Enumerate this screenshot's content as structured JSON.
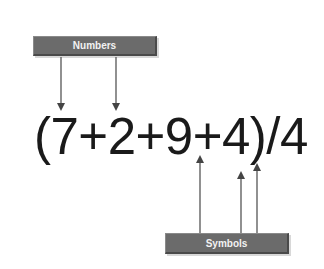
{
  "diagram": {
    "top_label": "Numbers",
    "bottom_label": "Symbols",
    "expression": "(7+2+9+4)/4",
    "colors": {
      "label_box": "#6b6b6b",
      "label_text": "#f2f2f2",
      "arrow": "#555555",
      "expression_text": "#1a1a1a"
    },
    "number_arrows": [
      {
        "target": "7"
      },
      {
        "target": "2"
      }
    ],
    "symbol_arrows": [
      {
        "target": "+"
      },
      {
        "target": ")"
      },
      {
        "target": "/"
      }
    ]
  }
}
